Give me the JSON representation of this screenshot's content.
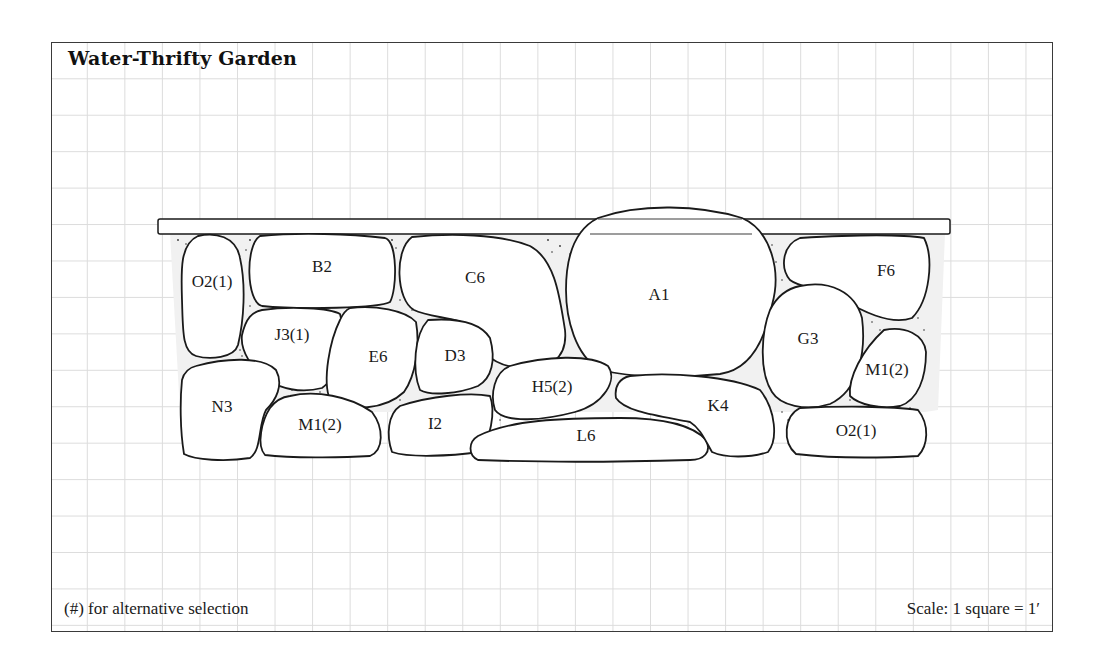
{
  "diagram": {
    "title": "Water-Thrifty Garden",
    "footnote": "(#) for alternative selection",
    "scale": "Scale: 1 square = 1′",
    "grid": {
      "square_ft": 1,
      "line_color": "#dcdcdc"
    },
    "wall_cap": "board",
    "stones": [
      {
        "id": "O2(1)",
        "label": "O2(1)",
        "position": "top-left"
      },
      {
        "id": "B2",
        "label": "B2",
        "position": "top"
      },
      {
        "id": "C6",
        "label": "C6",
        "position": "top-center"
      },
      {
        "id": "A1",
        "label": "A1",
        "position": "top-center-right (large boulder)"
      },
      {
        "id": "F6",
        "label": "F6",
        "position": "top-right"
      },
      {
        "id": "J3(1)",
        "label": "J3(1)",
        "position": "middle-left"
      },
      {
        "id": "E6",
        "label": "E6",
        "position": "middle"
      },
      {
        "id": "D3",
        "label": "D3",
        "position": "middle"
      },
      {
        "id": "G3",
        "label": "G3",
        "position": "middle-right"
      },
      {
        "id": "M1(2)-right",
        "label": "M1(2)",
        "position": "middle-right"
      },
      {
        "id": "H5(2)",
        "label": "H5(2)",
        "position": "lower-center"
      },
      {
        "id": "N3",
        "label": "N3",
        "position": "bottom-left"
      },
      {
        "id": "M1(2)-left",
        "label": "M1(2)",
        "position": "bottom-left"
      },
      {
        "id": "I2",
        "label": "I2",
        "position": "bottom"
      },
      {
        "id": "L6",
        "label": "L6",
        "position": "bottom-center"
      },
      {
        "id": "K4",
        "label": "K4",
        "position": "bottom-right"
      },
      {
        "id": "O2(1)-right",
        "label": "O2(1)",
        "position": "bottom-right"
      }
    ]
  }
}
